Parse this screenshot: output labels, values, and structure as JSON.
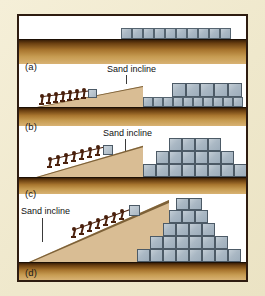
{
  "figure": {
    "background_color": "#f0e9cd",
    "frame_color": "#2e1c10",
    "panel_background": "#ffffff",
    "ground_top_color": "#3a1f07",
    "ground_bottom_color": "#d8b273",
    "sand_color": "#d9bd94",
    "block_color": "#aab8c4",
    "block_edge_color": "#4c5a66",
    "worker_color": "#4a200c"
  },
  "labels": {
    "a": "(a)",
    "b": "(b)",
    "c": "(c)",
    "d": "(d)"
  },
  "captions": {
    "sand_incline_a": "Sand incline",
    "sand_incline_b": "Sand incline",
    "sand_incline_c": "Sand incline"
  },
  "panels": [
    {
      "id": "panel-a",
      "label": "(a)",
      "stage": 1,
      "description": "Flat ground with a single row of stone blocks laid out",
      "worker_count": 0,
      "incline_present": false,
      "block_rows": [
        {
          "level": 1,
          "count": 10
        }
      ]
    },
    {
      "id": "panel-b",
      "label": "(b)",
      "stage": 2,
      "description": "Workers drag a block up a shallow sand incline; first course complete and second course begun",
      "worker_count": 7,
      "incline_present": true,
      "incline_label": "Sand incline",
      "block_rows": [
        {
          "level": 1,
          "count": 10
        },
        {
          "level": 2,
          "count": 5
        }
      ]
    },
    {
      "id": "panel-c",
      "label": "(c)",
      "stage": 3,
      "description": "Steeper sand incline; three stepped courses of blocks in place",
      "worker_count": 7,
      "incline_present": true,
      "incline_label": "Sand incline",
      "block_rows": [
        {
          "level": 1,
          "count": 9
        },
        {
          "level": 2,
          "count": 7
        },
        {
          "level": 3,
          "count": 5
        }
      ]
    },
    {
      "id": "panel-d",
      "label": "(d)",
      "stage": 4,
      "description": "Tall sand ramp reaching the summit; completed stepped pyramid of five courses",
      "worker_count": 7,
      "incline_present": true,
      "incline_label": "Sand incline",
      "block_rows": [
        {
          "level": 1,
          "count": 9
        },
        {
          "level": 2,
          "count": 7
        },
        {
          "level": 3,
          "count": 5
        },
        {
          "level": 4,
          "count": 3
        },
        {
          "level": 5,
          "count": 2
        }
      ]
    }
  ]
}
